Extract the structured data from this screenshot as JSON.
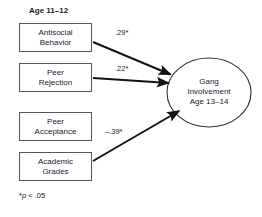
{
  "figure": {
    "group_title": "Age 11–12",
    "footnote_marker": "*",
    "footnote_p": "p",
    "footnote_rest": " < .05"
  },
  "predictors": [
    {
      "id": "antisocial-behavior",
      "label": "Antisocial\nBehavior"
    },
    {
      "id": "peer-rejection",
      "label": "Peer\nRejection"
    },
    {
      "id": "peer-acceptance",
      "label": "Peer\nAcceptance"
    },
    {
      "id": "academic-grades",
      "label": "Academic\nGrades"
    }
  ],
  "outcome": {
    "id": "gang-involvement",
    "label": "Gang\nInvolvement\nAge 13–14"
  },
  "paths": [
    {
      "from": "antisocial-behavior",
      "to": "gang-involvement",
      "coefficient": ".29*"
    },
    {
      "from": "peer-rejection",
      "to": "gang-involvement",
      "coefficient": ".22*"
    },
    {
      "from": "academic-grades",
      "to": "gang-involvement",
      "coefficient": "–.39*"
    }
  ],
  "colors": {
    "background": "#ffffff",
    "text": "#1a1a2e",
    "box_border": "#55565c",
    "ellipse_border": "#2e2e38",
    "arrow": "#111118"
  }
}
